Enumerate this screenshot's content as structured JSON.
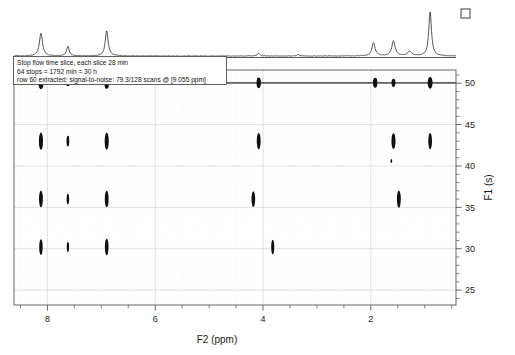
{
  "figure": {
    "title": "",
    "background_color": "#ffffff",
    "line_color": "#101010",
    "grid_color": "#d4d4d4"
  },
  "annotation": {
    "line1": "Stop flow time slice, each slice 28 min",
    "line2": "64 stops = 1792 min = 30 h",
    "line3": "row 60 extracted: signal-to-noise: 79.3/128 scans @ [9.055 ppm]"
  },
  "marker": {
    "name": "open-square-marker",
    "glyph": "square"
  },
  "chart_data": {
    "type": "scatter",
    "title": "",
    "xlabel": "F2 (ppm)",
    "ylabel": "F1 (s)",
    "xlim": [
      8.62,
      0.42
    ],
    "ylim": [
      23.2,
      51.6
    ],
    "x_ticks": [
      8,
      6,
      4,
      2
    ],
    "x_tick_labels": [
      "8",
      "6",
      "4",
      "2"
    ],
    "x_minor_ticks": [
      8.5,
      7.5,
      7.0,
      6.5,
      5.5,
      5.0,
      4.5,
      3.5,
      3.0,
      2.5,
      1.5,
      1.0,
      0.5
    ],
    "y_ticks": [
      50,
      45,
      40,
      35,
      30,
      25
    ],
    "y_tick_labels": [
      "50",
      "45",
      "40",
      "35",
      "30",
      "25"
    ],
    "y_minor_ticks": [
      51,
      49,
      48,
      47,
      46,
      44,
      43,
      42,
      41,
      39,
      38,
      37,
      36,
      34,
      33,
      32,
      31,
      29,
      28,
      27,
      26,
      24
    ],
    "x_axis_inverted": true,
    "y_axis_inverted": true,
    "grid": true,
    "legend": "none",
    "ridge": {
      "f1": 50.05,
      "label": "projection-ridge",
      "f2_start": 8.62,
      "f2_end": 0.42
    },
    "series": [
      {
        "name": "F1 = 50.0 s ridge peaks",
        "f1": 50.05,
        "points": [
          {
            "f2": 8.12,
            "intensity": 0.95,
            "width": 0.055,
            "height": 1.55
          },
          {
            "f2": 7.62,
            "intensity": 0.42,
            "width": 0.035,
            "height": 0.85
          },
          {
            "f2": 6.9,
            "intensity": 0.9,
            "width": 0.05,
            "height": 1.5
          },
          {
            "f2": 4.08,
            "intensity": 0.72,
            "width": 0.045,
            "height": 1.3
          },
          {
            "f2": 1.92,
            "intensity": 0.66,
            "width": 0.045,
            "height": 1.2
          },
          {
            "f2": 1.58,
            "intensity": 0.5,
            "width": 0.04,
            "height": 1.0
          },
          {
            "f2": 0.9,
            "intensity": 0.88,
            "width": 0.05,
            "height": 1.45
          }
        ]
      },
      {
        "name": "F1 = 43.0 s row",
        "f1": 43.0,
        "points": [
          {
            "f2": 8.12,
            "intensity": 0.82,
            "width": 0.042,
            "height": 2.1
          },
          {
            "f2": 7.62,
            "intensity": 0.34,
            "width": 0.028,
            "height": 1.3
          },
          {
            "f2": 6.9,
            "intensity": 0.8,
            "width": 0.042,
            "height": 2.1
          },
          {
            "f2": 4.08,
            "intensity": 0.76,
            "width": 0.04,
            "height": 2.0
          },
          {
            "f2": 1.58,
            "intensity": 0.7,
            "width": 0.042,
            "height": 1.9
          },
          {
            "f2": 0.9,
            "intensity": 0.74,
            "width": 0.038,
            "height": 2.0
          }
        ]
      },
      {
        "name": "F1 = 36.0 s row",
        "f1": 36.0,
        "points": [
          {
            "f2": 8.12,
            "intensity": 0.8,
            "width": 0.04,
            "height": 2.0
          },
          {
            "f2": 7.62,
            "intensity": 0.32,
            "width": 0.026,
            "height": 1.3
          },
          {
            "f2": 6.9,
            "intensity": 0.78,
            "width": 0.04,
            "height": 2.0
          },
          {
            "f2": 4.18,
            "intensity": 0.74,
            "width": 0.038,
            "height": 1.9
          },
          {
            "f2": 1.48,
            "intensity": 0.72,
            "width": 0.04,
            "height": 2.1
          }
        ]
      },
      {
        "name": "F1 = 30.2 s row",
        "f1": 30.2,
        "points": [
          {
            "f2": 8.12,
            "intensity": 0.72,
            "width": 0.036,
            "height": 1.9
          },
          {
            "f2": 7.62,
            "intensity": 0.3,
            "width": 0.024,
            "height": 1.2
          },
          {
            "f2": 6.9,
            "intensity": 0.74,
            "width": 0.038,
            "height": 2.0
          },
          {
            "f2": 3.82,
            "intensity": 0.62,
            "width": 0.032,
            "height": 1.8
          }
        ]
      },
      {
        "name": "weak artifact",
        "f1": 40.6,
        "points": [
          {
            "f2": 1.62,
            "intensity": 0.08,
            "width": 0.012,
            "height": 0.5
          }
        ]
      }
    ],
    "projection_1d": {
      "name": "F2 projection trace",
      "peaks": [
        {
          "ppm": 8.12,
          "height": 0.52,
          "width": 0.035
        },
        {
          "ppm": 7.62,
          "height": 0.22,
          "width": 0.028
        },
        {
          "ppm": 6.9,
          "height": 0.58,
          "width": 0.032
        },
        {
          "ppm": 4.08,
          "height": 0.06,
          "width": 0.03
        },
        {
          "ppm": 3.35,
          "height": 0.03,
          "width": 0.025
        },
        {
          "ppm": 1.95,
          "height": 0.3,
          "width": 0.035
        },
        {
          "ppm": 1.58,
          "height": 0.34,
          "width": 0.038
        },
        {
          "ppm": 1.28,
          "height": 0.1,
          "width": 0.045
        },
        {
          "ppm": 0.9,
          "height": 1.0,
          "width": 0.03
        }
      ]
    }
  }
}
